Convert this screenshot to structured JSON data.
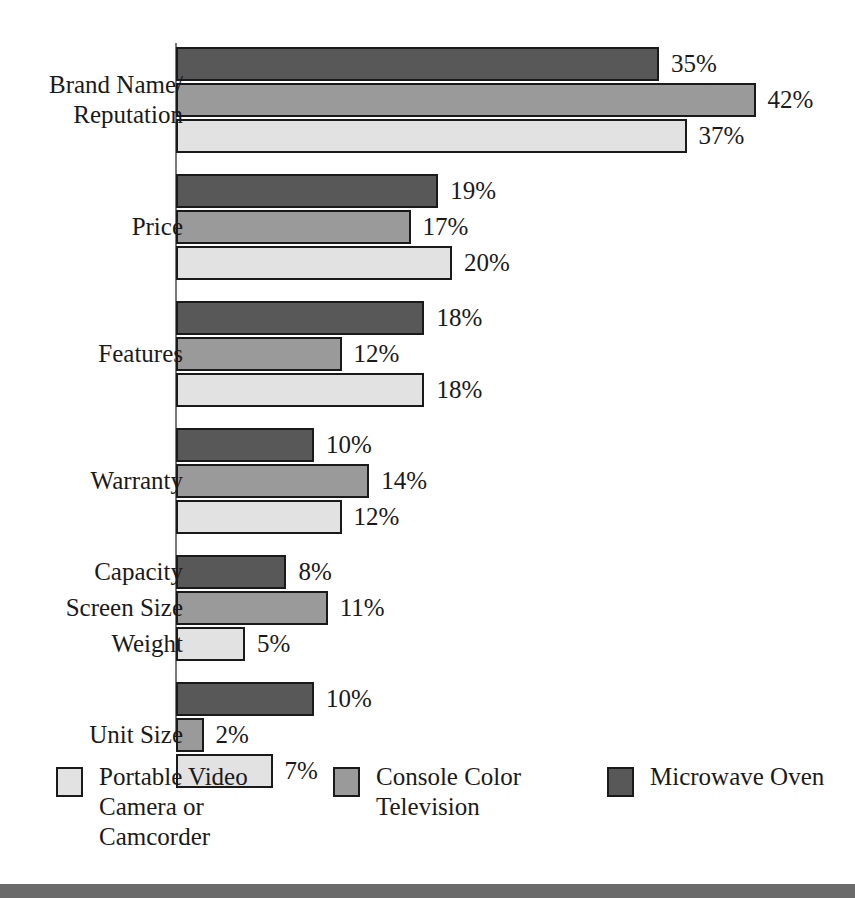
{
  "chart_data": {
    "type": "bar",
    "orientation": "horizontal",
    "title": "",
    "xlabel": "",
    "ylabel": "",
    "xlim": [
      0,
      42
    ],
    "grid": false,
    "value_suffix": "%",
    "legend_position": "bottom",
    "categories": [
      "Brand Name/\nReputation",
      "Price",
      "Features",
      "Warranty",
      "Capacity / Screen Size / Weight",
      "Unit Size"
    ],
    "series": [
      {
        "name": "Microwave Oven",
        "key": "microwave",
        "color": "#585858",
        "values": [
          35,
          19,
          18,
          10,
          8,
          10
        ],
        "value_labels": [
          "35%",
          "19%",
          "18%",
          "10%",
          "8%",
          "10%"
        ]
      },
      {
        "name": "Console Color Television",
        "key": "television",
        "color": "#9a9a9a",
        "values": [
          42,
          17,
          12,
          14,
          11,
          2
        ],
        "value_labels": [
          "42%",
          "17%",
          "12%",
          "14%",
          "11%",
          "2%"
        ]
      },
      {
        "name": "Portable Video Camera or Camcorder",
        "key": "camcorder",
        "color": "#e2e2e2",
        "values": [
          37,
          20,
          18,
          12,
          5,
          7
        ],
        "value_labels": [
          "37%",
          "20%",
          "18%",
          "12%",
          "5%",
          "7%"
        ]
      }
    ]
  },
  "groups": [
    {
      "label_lines": [
        "Brand Name/",
        "Reputation"
      ],
      "single_label": false,
      "rows": [
        {
          "series": "microwave",
          "value_label": "35%",
          "row_label": ""
        },
        {
          "series": "television",
          "value_label": "42%",
          "row_label": ""
        },
        {
          "series": "camcorder",
          "value_label": "37%",
          "row_label": ""
        }
      ]
    },
    {
      "label_lines": [
        "Price"
      ],
      "single_label": true,
      "rows": [
        {
          "series": "microwave",
          "value_label": "19%",
          "row_label": ""
        },
        {
          "series": "television",
          "value_label": "17%",
          "row_label": ""
        },
        {
          "series": "camcorder",
          "value_label": "20%",
          "row_label": ""
        }
      ]
    },
    {
      "label_lines": [
        "Features"
      ],
      "single_label": true,
      "rows": [
        {
          "series": "microwave",
          "value_label": "18%",
          "row_label": ""
        },
        {
          "series": "television",
          "value_label": "12%",
          "row_label": ""
        },
        {
          "series": "camcorder",
          "value_label": "18%",
          "row_label": ""
        }
      ]
    },
    {
      "label_lines": [
        "Warranty"
      ],
      "single_label": true,
      "rows": [
        {
          "series": "microwave",
          "value_label": "10%",
          "row_label": ""
        },
        {
          "series": "television",
          "value_label": "14%",
          "row_label": ""
        },
        {
          "series": "camcorder",
          "value_label": "12%",
          "row_label": ""
        }
      ]
    },
    {
      "label_lines": [],
      "single_label": false,
      "per_row_labels": true,
      "rows": [
        {
          "series": "microwave",
          "value_label": "8%",
          "row_label": "Capacity"
        },
        {
          "series": "television",
          "value_label": "11%",
          "row_label": "Screen Size"
        },
        {
          "series": "camcorder",
          "value_label": "5%",
          "row_label": "Weight"
        }
      ]
    },
    {
      "label_lines": [
        "Unit Size"
      ],
      "single_label": true,
      "rows": [
        {
          "series": "microwave",
          "value_label": "10%",
          "row_label": ""
        },
        {
          "series": "television",
          "value_label": "2%",
          "row_label": ""
        },
        {
          "series": "camcorder",
          "value_label": "7%",
          "row_label": ""
        }
      ]
    }
  ],
  "legend": {
    "items": [
      {
        "key": "camcorder",
        "label": "Portable Video\nCamera or\nCamcorder",
        "color": "#e2e2e2"
      },
      {
        "key": "television",
        "label": "Console Color\nTelevision",
        "color": "#9a9a9a"
      },
      {
        "key": "microwave",
        "label": "Microwave Oven",
        "color": "#585858"
      }
    ]
  },
  "colors": {
    "microwave": "#585858",
    "television": "#9a9a9a",
    "camcorder": "#e2e2e2",
    "axis": "#7a7a7a",
    "outline": "#1a1a1a",
    "footer_rule": "#6b6b6b",
    "background": "#ffffff"
  }
}
